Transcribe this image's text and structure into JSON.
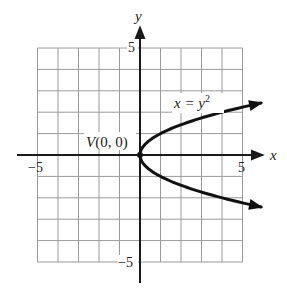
{
  "chart_data": {
    "type": "line",
    "title": "",
    "xlabel": "x",
    "ylabel": "y",
    "xlim": [
      -5,
      5
    ],
    "ylim": [
      -5,
      5
    ],
    "grid": true,
    "tick_labels": {
      "x_neg": "−5",
      "x_pos": "5",
      "y_pos": "5",
      "y_neg": "−5"
    },
    "series": [
      {
        "name": "x = y²",
        "equation": "x = y^2",
        "points": [
          {
            "x": 5.9,
            "y": 2.43
          },
          {
            "x": 4,
            "y": 2
          },
          {
            "x": 1,
            "y": 1
          },
          {
            "x": 0.25,
            "y": 0.5
          },
          {
            "x": 0,
            "y": 0
          },
          {
            "x": 0.25,
            "y": -0.5
          },
          {
            "x": 1,
            "y": -1
          },
          {
            "x": 4,
            "y": -2
          },
          {
            "x": 5.9,
            "y": -2.43
          }
        ],
        "arrows_at_ends": true
      }
    ],
    "annotations": [
      {
        "text": "V(0, 0)",
        "x": 0,
        "y": 0,
        "type": "vertex"
      },
      {
        "text_main": "x = y",
        "text_sup": "2",
        "x": 2.6,
        "y": 1.9,
        "type": "equation-label"
      }
    ],
    "colors": {
      "grid": "#9a9a9a",
      "axes": "#1a1a1a",
      "curve": "#111111"
    }
  }
}
